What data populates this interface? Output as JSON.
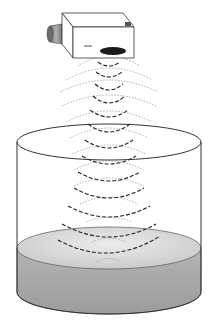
{
  "figure": {
    "components": [
      "sensor",
      "transducer-face",
      "sound-waves",
      "tank",
      "liquid"
    ],
    "colors": {
      "background": "#ffffff",
      "outline": "#333333",
      "wave_dark": "#222222",
      "wave_light": "#9a9a9a",
      "liquid_side": "#a8a8a8",
      "liquid_surface": "#d4d4d4",
      "transducer": "#1a1a1a",
      "connector": "#8c8c8c"
    },
    "wave_count": 12
  }
}
